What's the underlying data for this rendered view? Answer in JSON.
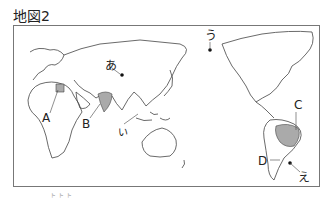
{
  "title": "地図2",
  "labels": {
    "A": "A",
    "B": "B",
    "C": "C",
    "D": "D",
    "a": "あ",
    "i": "い",
    "u": "う",
    "e": "え"
  },
  "shaded_regions": [
    "Egypt (A)",
    "India (B)",
    "Brazil (C)"
  ],
  "colors": {
    "coast": "#444444",
    "shade": "#aaaaaa",
    "frame": "#777777"
  },
  "footnote": "ト ト ト"
}
